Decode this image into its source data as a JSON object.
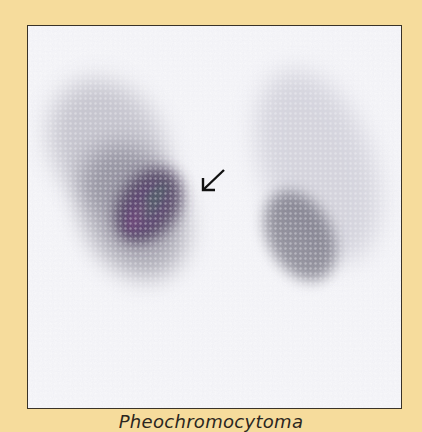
{
  "figure": {
    "caption": "Pheochromocytoma",
    "image_description": "Nuclear medicine adrenal/renal scan with arrow pointing to a hot spot (left-sided lesion)",
    "colors": {
      "background": "#f6dc9c",
      "frame_border": "#3a3328",
      "scan_background": "#f7f7fa"
    },
    "annotations": [
      {
        "type": "arrow",
        "direction": "down-left",
        "target": "left-adrenal-lesion"
      }
    ]
  }
}
